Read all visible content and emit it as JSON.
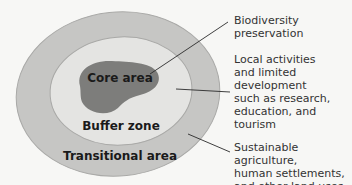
{
  "diagram": {
    "type": "biosphere-reserve-zones",
    "colors": {
      "background": "#f7f7f5",
      "transitional": "#c6c6c4",
      "buffer": "#e4e4e2",
      "core": "#7d7d7b",
      "stroke": "#a9a9a7",
      "leader": "#2a2a2a"
    },
    "zones": [
      {
        "id": "core",
        "label": "Core area"
      },
      {
        "id": "buffer",
        "label": "Buffer zone"
      },
      {
        "id": "transitional",
        "label": "Transitional area"
      }
    ],
    "annotations": [
      {
        "zone": "core",
        "text": "Biodiversity\npreservation"
      },
      {
        "zone": "buffer",
        "text": "Local activities\nand limited\ndevelopment\nsuch as research,\neducation, and\ntourism"
      },
      {
        "zone": "transitional",
        "text": "Sustainable agriculture,\nhuman settlements,\nand other land uses"
      }
    ]
  }
}
